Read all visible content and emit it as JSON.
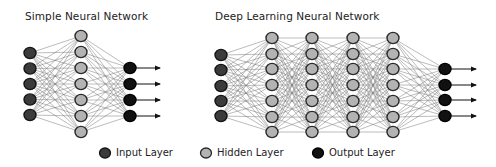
{
  "diagrams": [
    {
      "id": "simple",
      "title": "Simple Neural Network",
      "title_pos": [
        25,
        10
      ],
      "layers": [
        {
          "type": "input",
          "x": 30,
          "ys": [
            53,
            68.5,
            84,
            99.5,
            115
          ]
        },
        {
          "type": "hidden",
          "x": 81,
          "ys": [
            36,
            52,
            68,
            84,
            100,
            116,
            132
          ]
        },
        {
          "type": "output",
          "x": 130,
          "ys": [
            68,
            84,
            100,
            116
          ]
        }
      ],
      "arrow_end_x": 160
    },
    {
      "id": "deep",
      "title": "Deep Learning Neural Network",
      "title_pos": [
        215,
        10
      ],
      "layers": [
        {
          "type": "input",
          "x": 221,
          "ys": [
            55,
            70,
            86,
            101,
            116
          ]
        },
        {
          "type": "hidden",
          "x": 272,
          "ys": [
            38,
            54,
            69,
            85,
            101,
            117,
            132
          ]
        },
        {
          "type": "hidden",
          "x": 312,
          "ys": [
            38,
            54,
            69,
            85,
            101,
            117,
            132
          ]
        },
        {
          "type": "hidden",
          "x": 353,
          "ys": [
            38,
            54,
            69,
            85,
            101,
            117,
            132
          ]
        },
        {
          "type": "hidden",
          "x": 393,
          "ys": [
            38,
            54,
            69,
            85,
            101,
            117,
            132
          ]
        },
        {
          "type": "output",
          "x": 445,
          "ys": [
            69,
            85,
            100,
            116
          ]
        }
      ],
      "arrow_end_x": 476
    }
  ],
  "legend": {
    "items": [
      {
        "label": "Input Layer",
        "type": "input",
        "x": 105,
        "y": 153,
        "text_x": 116
      },
      {
        "label": "Hidden Layer",
        "type": "hidden",
        "x": 206,
        "y": 153,
        "text_x": 217
      },
      {
        "label": "Output Layer",
        "type": "output",
        "x": 318,
        "y": 153,
        "text_x": 329
      }
    ]
  },
  "styles": {
    "input": {
      "fill": "#3b3b3b",
      "stroke": "#141414"
    },
    "hidden": {
      "fill": "#b3b3b3",
      "stroke": "#2a2a2a"
    },
    "output": {
      "fill": "#111111",
      "stroke": "#000000"
    },
    "edge_color": "#7a7a7a",
    "arrow_color": "#111111"
  }
}
